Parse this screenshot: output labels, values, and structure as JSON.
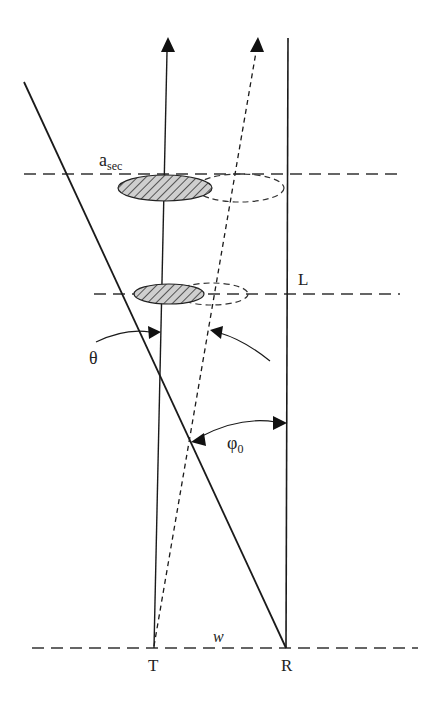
{
  "diagram": {
    "labels": {
      "a_sec_main": "a",
      "a_sec_sub": "sec",
      "L": "L",
      "theta": "θ",
      "phi_main": "φ",
      "phi_sub": "0",
      "w": "w",
      "T": "T",
      "R": "R"
    },
    "colors": {
      "stroke": "#1a1a1a",
      "hatch_fill": "#9a9a9a",
      "background": "#ffffff"
    }
  }
}
